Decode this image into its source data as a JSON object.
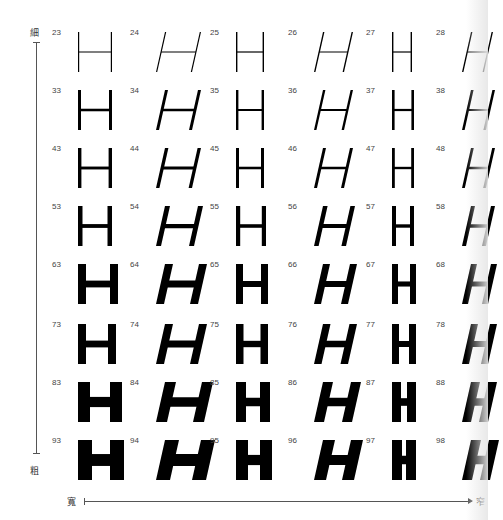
{
  "axes": {
    "vertical_top_label": "細",
    "vertical_bottom_label": "粗",
    "horizontal_left_label": "寬",
    "horizontal_right_label": "窄"
  },
  "glyph_letter": "H",
  "rows": [
    {
      "weight_index": 1,
      "cells": [
        {
          "num": "23",
          "italic": false,
          "stroke": 1.2,
          "width": 34
        },
        {
          "num": "24",
          "italic": true,
          "stroke": 1.2,
          "width": 36
        },
        {
          "num": "25",
          "italic": false,
          "stroke": 1.4,
          "width": 28
        },
        {
          "num": "26",
          "italic": true,
          "stroke": 1.4,
          "width": 30
        },
        {
          "num": "27",
          "italic": false,
          "stroke": 1.4,
          "width": 20
        },
        {
          "num": "28",
          "italic": true,
          "stroke": 1.4,
          "width": 22
        }
      ]
    },
    {
      "weight_index": 2,
      "cells": [
        {
          "num": "33",
          "italic": false,
          "stroke": 3,
          "width": 34
        },
        {
          "num": "34",
          "italic": true,
          "stroke": 3,
          "width": 36
        },
        {
          "num": "35",
          "italic": false,
          "stroke": 2.4,
          "width": 28
        },
        {
          "num": "36",
          "italic": true,
          "stroke": 2.4,
          "width": 30
        },
        {
          "num": "37",
          "italic": false,
          "stroke": 2.6,
          "width": 22
        },
        {
          "num": "38",
          "italic": true,
          "stroke": 2.6,
          "width": 24
        }
      ]
    },
    {
      "weight_index": 3,
      "cells": [
        {
          "num": "43",
          "italic": false,
          "stroke": 3.4,
          "width": 34
        },
        {
          "num": "44",
          "italic": true,
          "stroke": 3.4,
          "width": 36
        },
        {
          "num": "45",
          "italic": false,
          "stroke": 3,
          "width": 28
        },
        {
          "num": "46",
          "italic": true,
          "stroke": 3,
          "width": 30
        },
        {
          "num": "47",
          "italic": false,
          "stroke": 2.8,
          "width": 22
        },
        {
          "num": "48",
          "italic": true,
          "stroke": 2.8,
          "width": 24
        }
      ]
    },
    {
      "weight_index": 4,
      "cells": [
        {
          "num": "53",
          "italic": false,
          "stroke": 4.5,
          "width": 34
        },
        {
          "num": "54",
          "italic": true,
          "stroke": 5,
          "width": 38
        },
        {
          "num": "55",
          "italic": false,
          "stroke": 4.2,
          "width": 30
        },
        {
          "num": "56",
          "italic": true,
          "stroke": 4.6,
          "width": 32
        },
        {
          "num": "57",
          "italic": false,
          "stroke": 4,
          "width": 22
        },
        {
          "num": "58",
          "italic": true,
          "stroke": 4,
          "width": 24
        }
      ]
    },
    {
      "weight_index": 5,
      "cells": [
        {
          "num": "63",
          "italic": false,
          "stroke": 8,
          "width": 40
        },
        {
          "num": "64",
          "italic": true,
          "stroke": 8,
          "width": 42
        },
        {
          "num": "65",
          "italic": false,
          "stroke": 7,
          "width": 32
        },
        {
          "num": "66",
          "italic": true,
          "stroke": 7,
          "width": 34
        },
        {
          "num": "67",
          "italic": false,
          "stroke": 6,
          "width": 24
        },
        {
          "num": "68",
          "italic": true,
          "stroke": 6,
          "width": 26
        }
      ]
    },
    {
      "weight_index": 6,
      "cells": [
        {
          "num": "73",
          "italic": false,
          "stroke": 8,
          "width": 38
        },
        {
          "num": "74",
          "italic": true,
          "stroke": 8,
          "width": 42
        },
        {
          "num": "75",
          "italic": false,
          "stroke": 7.5,
          "width": 32
        },
        {
          "num": "76",
          "italic": true,
          "stroke": 7.5,
          "width": 34
        },
        {
          "num": "77",
          "italic": false,
          "stroke": 7,
          "width": 24
        },
        {
          "num": "78",
          "italic": true,
          "stroke": 7,
          "width": 26
        }
      ]
    },
    {
      "weight_index": 7,
      "cells": [
        {
          "num": "83",
          "italic": false,
          "stroke": 12,
          "width": 44
        },
        {
          "num": "84",
          "italic": true,
          "stroke": 11,
          "width": 48
        },
        {
          "num": "85",
          "italic": false,
          "stroke": 10,
          "width": 34
        },
        {
          "num": "86",
          "italic": true,
          "stroke": 10,
          "width": 38
        },
        {
          "num": "87",
          "italic": false,
          "stroke": 9,
          "width": 24
        },
        {
          "num": "88",
          "italic": true,
          "stroke": 9,
          "width": 26
        }
      ]
    },
    {
      "weight_index": 8,
      "cells": [
        {
          "num": "93",
          "italic": false,
          "stroke": 14,
          "width": 46
        },
        {
          "num": "94",
          "italic": true,
          "stroke": 14,
          "width": 50
        },
        {
          "num": "95",
          "italic": false,
          "stroke": 12,
          "width": 36
        },
        {
          "num": "96",
          "italic": true,
          "stroke": 12,
          "width": 40
        },
        {
          "num": "97",
          "italic": false,
          "stroke": 10,
          "width": 24
        },
        {
          "num": "98",
          "italic": true,
          "stroke": 10,
          "width": 28
        }
      ]
    }
  ]
}
